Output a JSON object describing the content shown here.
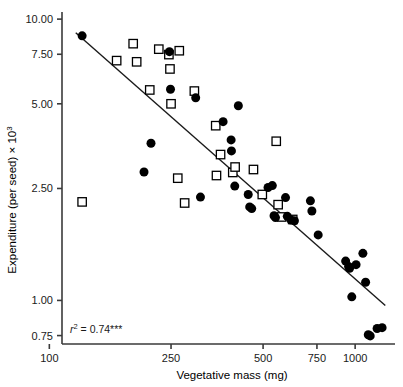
{
  "chart_data": {
    "type": "scatter",
    "title": "",
    "xlabel": "Vegetative mass (mg)",
    "ylabel": "Expenditure (per seed) × 10³",
    "ylabel_parts": {
      "base": "Expenditure (per seed) × 10",
      "exponent": "3"
    },
    "xscale": "log",
    "yscale": "log",
    "xlim": [
      110,
      1350
    ],
    "ylim": [
      0.7,
      10.6
    ],
    "xticks": [
      100,
      250,
      500,
      750,
      1000
    ],
    "xticklabels": [
      "100",
      "250",
      "500",
      "750",
      "1000"
    ],
    "yticks": [
      10.0,
      7.5,
      5.0,
      2.5,
      1.0,
      0.75
    ],
    "yticklabels": [
      "10.00",
      "7.50",
      "5.00",
      "2.50",
      "1.00",
      "0.75"
    ],
    "grid": false,
    "legend": false,
    "annotation": {
      "text_prefix": "r",
      "text_exponent": "2",
      "text_suffix": " = 0.74***",
      "full": "r2 = 0.74***"
    },
    "regression_line": {
      "x_start": 122,
      "y_start": 8.95,
      "x_end": 1255,
      "y_end": 0.96
    },
    "series": [
      {
        "name": "filled-circles",
        "marker": "circle",
        "fill": "#000000",
        "points": [
          [
            128,
            8.72
          ],
          [
            247,
            7.66
          ],
          [
            249,
            5.63
          ],
          [
            301,
            5.25
          ],
          [
            215,
            3.62
          ],
          [
            204,
            2.86
          ],
          [
            370,
            4.32
          ],
          [
            415,
            4.92
          ],
          [
            393,
            3.72
          ],
          [
            394,
            3.4
          ],
          [
            404,
            2.55
          ],
          [
            312,
            2.33
          ],
          [
            447,
            2.38
          ],
          [
            452,
            2.15
          ],
          [
            459,
            2.12
          ],
          [
            519,
            2.52
          ],
          [
            536,
            2.56
          ],
          [
            543,
            2.0
          ],
          [
            549,
            1.97
          ],
          [
            592,
            2.32
          ],
          [
            600,
            1.99
          ],
          [
            617,
            1.93
          ],
          [
            633,
            1.92
          ],
          [
            714,
            2.26
          ],
          [
            722,
            2.08
          ],
          [
            757,
            1.71
          ],
          [
            931,
            1.38
          ],
          [
            952,
            1.32
          ],
          [
            959,
            1.3
          ],
          [
            975,
            1.03
          ],
          [
            1007,
            1.34
          ],
          [
            1060,
            1.47
          ],
          [
            1082,
            1.16
          ],
          [
            1104,
            0.755
          ],
          [
            1120,
            0.748
          ],
          [
            1180,
            0.795
          ],
          [
            1225,
            0.8
          ]
        ]
      },
      {
        "name": "open-squares",
        "marker": "square",
        "fill": "#ffffff",
        "points": [
          [
            128,
            2.24
          ],
          [
            166,
            7.12
          ],
          [
            188,
            8.18
          ],
          [
            193,
            7.05
          ],
          [
            228,
            7.82
          ],
          [
            246,
            7.48
          ],
          [
            248,
            6.65
          ],
          [
            266,
            7.72
          ],
          [
            250,
            5.0
          ],
          [
            263,
            2.72
          ],
          [
            277,
            2.22
          ],
          [
            213,
            5.6
          ],
          [
            298,
            5.55
          ],
          [
            350,
            4.18
          ],
          [
            352,
            2.78
          ],
          [
            363,
            3.3
          ],
          [
            398,
            2.85
          ],
          [
            405,
            2.98
          ],
          [
            465,
            2.92
          ],
          [
            497,
            2.38
          ],
          [
            552,
            3.68
          ],
          [
            560,
            2.19
          ],
          [
            575,
            1.98
          ],
          [
            625,
            1.94
          ]
        ]
      }
    ]
  }
}
